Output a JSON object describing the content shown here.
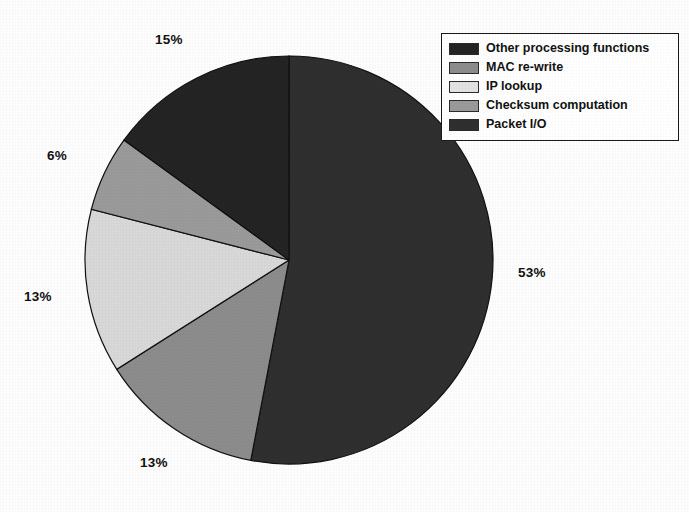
{
  "chart_data": {
    "type": "pie",
    "title": "",
    "labels": [
      "Packet I/O",
      "MAC re-write",
      "IP lookup",
      "Checksum computation",
      "Other processing functions"
    ],
    "values": [
      53,
      13,
      13,
      6,
      15
    ],
    "value_labels": [
      "53%",
      "13%",
      "13%",
      "6%",
      "15%"
    ],
    "units": "percent",
    "legend_position": "top-right",
    "grid": false,
    "start_angle_deg": 0,
    "direction": "clockwise",
    "colors": [
      "#2f2f2f",
      "#8c8c8c",
      "#d8d8d8",
      "#9a9a9a",
      "#242424"
    ],
    "slices": [
      {
        "label": "Packet I/O",
        "value": 53,
        "value_label": "53%",
        "color": "#2f2f2f"
      },
      {
        "label": "MAC re-write",
        "value": 13,
        "value_label": "13%",
        "color": "#8c8c8c"
      },
      {
        "label": "IP lookup",
        "value": 13,
        "value_label": "13%",
        "color": "#d8d8d8"
      },
      {
        "label": "Checksum computation",
        "value": 6,
        "value_label": "6%",
        "color": "#9a9a9a"
      },
      {
        "label": "Other processing functions",
        "value": 15,
        "value_label": "15%",
        "color": "#242424"
      }
    ]
  },
  "legend": {
    "entries": [
      {
        "label": "Other processing functions",
        "color": "#242424"
      },
      {
        "label": "MAC re-write",
        "color": "#8c8c8c"
      },
      {
        "label": "IP lookup",
        "color": "#e2e2e2"
      },
      {
        "label": "Checksum computation",
        "color": "#9a9a9a"
      },
      {
        "label": "Packet I/O",
        "color": "#2f2f2f"
      }
    ]
  },
  "labels_on_chart": [
    {
      "text": "15%",
      "x": 155,
      "y": 32
    },
    {
      "text": "6%",
      "x": 47,
      "y": 148
    },
    {
      "text": "13%",
      "x": 24,
      "y": 289
    },
    {
      "text": "13%",
      "x": 140,
      "y": 455
    },
    {
      "text": "53%",
      "x": 518,
      "y": 265
    }
  ]
}
